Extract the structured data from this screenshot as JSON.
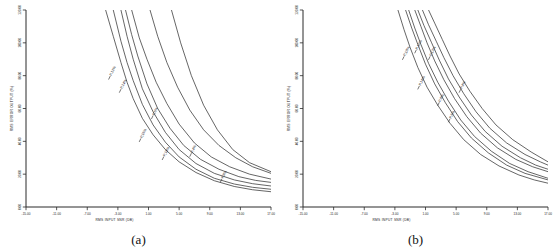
{
  "figure": {
    "panel_a_caption": "(a)",
    "panel_b_caption": "(b)"
  },
  "chart_data": [
    {
      "type": "line",
      "panel": "(a)",
      "title": "",
      "xlabel": "RMS INPUT SNR (DB)",
      "ylabel": "RMS ERROR OUTPUT (%)",
      "xlim": [
        -15.0,
        17.0
      ],
      "ylim": [
        0.0,
        120.0
      ],
      "xticks": [
        -15.0,
        -11.0,
        -7.0,
        -3.0,
        1.0,
        5.0,
        9.0,
        13.0,
        17.0
      ],
      "xticklabels": [
        "-15.00",
        "-11.00",
        "-7.00",
        "-3.00",
        "1.00",
        "5.00",
        "9.00",
        "13.00",
        "17.00"
      ],
      "yticks": [
        0.0,
        20.0,
        40.0,
        60.0,
        80.0,
        100.0,
        120.0
      ],
      "yticklabels": [
        "0.00",
        "20.00",
        "40.00",
        "60.00",
        "80.00",
        "100.00",
        "120.00"
      ],
      "grid": false,
      "legend": "inline-curve-labels",
      "series": [
        {
          "name": "P,12%",
          "label": "P,12%",
          "label_x": -3.6,
          "label_y": 82.0,
          "x": [
            -4.6,
            -3.6,
            -2.6,
            -1.8,
            -1.0,
            0.2,
            1.6,
            3.2,
            5.0,
            7.2,
            9.6,
            12.2,
            14.6,
            17.0
          ],
          "y": [
            120.0,
            104.0,
            88.0,
            76.0,
            66.0,
            54.0,
            44.0,
            35.0,
            27.5,
            21.0,
            16.0,
            12.5,
            10.5,
            9.3
          ]
        },
        {
          "name": "P,14%",
          "label": "P,14%",
          "label_x": -2.2,
          "label_y": 74.0,
          "x": [
            -3.6,
            -2.6,
            -1.8,
            -1.0,
            0.2,
            1.6,
            3.2,
            5.0,
            7.2,
            9.6,
            12.2,
            14.6,
            17.0
          ],
          "y": [
            120.0,
            101.0,
            88.0,
            77.0,
            62.5,
            50.0,
            39.5,
            30.5,
            23.0,
            17.5,
            14.0,
            12.0,
            10.8
          ]
        },
        {
          "name": "P,16%",
          "label": "P,16%",
          "label_x": 0.4,
          "label_y": 44.0,
          "x": [
            -2.6,
            -1.8,
            -1.0,
            0.2,
            1.6,
            3.2,
            5.0,
            7.2,
            9.6,
            12.2,
            14.6,
            17.0
          ],
          "y": [
            120.0,
            104.0,
            90.0,
            72.0,
            58.0,
            45.5,
            35.0,
            26.5,
            20.5,
            16.5,
            14.2,
            12.8
          ]
        },
        {
          "name": "P,18%",
          "label": "P,18%",
          "label_x": 3.4,
          "label_y": 33.0,
          "x": [
            -2.0,
            -1.2,
            -0.4,
            0.8,
            2.2,
            3.8,
            5.6,
            7.8,
            10.2,
            12.8,
            15.0,
            17.0
          ],
          "y": [
            120.0,
            105.0,
            92.0,
            75.0,
            60.0,
            48.0,
            37.5,
            29.0,
            23.0,
            18.5,
            16.2,
            15.0
          ]
        },
        {
          "name": "P,6%",
          "label": "P,6%",
          "label_x": 2.0,
          "label_y": 58.0,
          "x": [
            -1.2,
            -0.2,
            0.8,
            2.0,
            3.4,
            5.0,
            7.0,
            9.2,
            11.6,
            14.2,
            17.0
          ],
          "y": [
            120.0,
            103.0,
            90.0,
            76.0,
            63.0,
            50.5,
            39.0,
            30.5,
            24.5,
            20.0,
            17.0
          ]
        },
        {
          "name": "P,4%",
          "label": "P,4%",
          "label_x": 7.0,
          "label_y": 35.0,
          "x": [
            1.2,
            2.2,
            3.4,
            4.8,
            6.4,
            8.2,
            10.2,
            12.4,
            14.6,
            17.0
          ],
          "y": [
            120.0,
            104.0,
            88.0,
            73.0,
            59.0,
            47.0,
            37.5,
            30.0,
            24.5,
            20.5
          ]
        },
        {
          "name": "P,8%",
          "label": "P,8%",
          "label_x": 11.0,
          "label_y": 19.5,
          "x": [
            4.0,
            5.2,
            6.6,
            8.2,
            10.0,
            12.0,
            14.2,
            17.0
          ],
          "y": [
            120.0,
            100.0,
            80.0,
            62.0,
            47.0,
            35.0,
            27.0,
            21.5
          ]
        }
      ]
    },
    {
      "type": "line",
      "panel": "(b)",
      "title": "",
      "xlabel": "RMS INPUT SNR (DB)",
      "ylabel": "RMS ERROR OUTPUT (%)",
      "xlim": [
        -15.0,
        17.0
      ],
      "ylim": [
        0.0,
        120.0
      ],
      "xticks": [
        -15.0,
        -11.0,
        -7.0,
        -3.0,
        1.0,
        5.0,
        9.0,
        13.0,
        17.0
      ],
      "xticklabels": [
        "-15.00",
        "-11.00",
        "-7.00",
        "-3.00",
        "1.00",
        "5.00",
        "9.00",
        "13.00",
        "17.00"
      ],
      "yticks": [
        0.0,
        20.0,
        40.0,
        60.0,
        80.0,
        100.0,
        120.0
      ],
      "yticklabels": [
        "0.00",
        "20.00",
        "40.00",
        "60.00",
        "80.00",
        "100.00",
        "120.00"
      ],
      "grid": false,
      "legend": "inline-curve-labels",
      "series": [
        {
          "name": "P,18%",
          "label": "P,18%",
          "label_x": -1.4,
          "label_y": 94.0,
          "x": [
            -2.6,
            -1.8,
            -1.0,
            0.0,
            1.2,
            2.6,
            4.2,
            6.0,
            8.2,
            10.6,
            13.2,
            15.2,
            17.0
          ],
          "y": [
            120.0,
            108.0,
            97.0,
            85.0,
            73.0,
            62.0,
            51.0,
            41.0,
            32.0,
            25.0,
            19.5,
            16.5,
            14.5
          ]
        },
        {
          "name": "P,16%",
          "label": "P,16%",
          "label_x": 0.2,
          "label_y": 98.0,
          "x": [
            -1.6,
            -0.8,
            0.0,
            1.0,
            2.2,
            3.6,
            5.2,
            7.0,
            9.2,
            11.6,
            14.0,
            17.0
          ],
          "y": [
            120.0,
            109.0,
            99.0,
            87.0,
            75.0,
            63.5,
            52.0,
            42.0,
            33.0,
            25.5,
            20.5,
            16.5
          ]
        },
        {
          "name": "P,14%",
          "label": "P,14%",
          "label_x": 0.6,
          "label_y": 76.0,
          "x": [
            -1.2,
            -0.4,
            0.4,
            1.4,
            2.6,
            4.0,
            5.6,
            7.4,
            9.6,
            12.0,
            14.4,
            17.0
          ],
          "y": [
            120.0,
            109.0,
            99.0,
            87.5,
            76.0,
            64.5,
            53.0,
            43.0,
            34.0,
            26.5,
            21.5,
            17.5
          ]
        },
        {
          "name": "P,12%",
          "label": "P,12%",
          "label_x": 2.0,
          "label_y": 94.0,
          "x": [
            -0.4,
            0.4,
            1.2,
            2.2,
            3.4,
            4.8,
            6.4,
            8.2,
            10.4,
            12.8,
            15.0,
            17.0
          ],
          "y": [
            120.0,
            110.0,
            100.0,
            89.0,
            77.5,
            66.0,
            55.0,
            45.0,
            36.0,
            29.0,
            24.5,
            21.5
          ]
        },
        {
          "name": "P,8%",
          "label": "P,8%",
          "label_x": 3.2,
          "label_y": 66.0,
          "x": [
            0.0,
            0.8,
            1.8,
            2.8,
            4.0,
            5.4,
            7.0,
            8.8,
            11.0,
            13.4,
            15.4,
            17.0
          ],
          "y": [
            120.0,
            110.5,
            100.0,
            89.5,
            78.0,
            67.0,
            56.0,
            46.0,
            37.0,
            30.0,
            25.5,
            23.0
          ]
        },
        {
          "name": "P,6%",
          "label": "P,6%",
          "label_x": 4.6,
          "label_y": 56.0,
          "x": [
            0.6,
            1.4,
            2.4,
            3.4,
            4.6,
            6.0,
            7.6,
            9.4,
            11.6,
            14.0,
            16.0,
            17.0
          ],
          "y": [
            120.0,
            111.0,
            101.0,
            91.0,
            80.0,
            69.0,
            58.0,
            48.0,
            39.0,
            32.0,
            27.5,
            25.5
          ]
        },
        {
          "name": "P,4%",
          "label": "P,4%",
          "label_x": 6.0,
          "label_y": 74.0,
          "x": [
            1.4,
            2.2,
            3.2,
            4.2,
            5.4,
            6.8,
            8.4,
            10.2,
            12.4,
            14.8,
            17.0
          ],
          "y": [
            120.0,
            112.0,
            102.0,
            92.0,
            81.0,
            70.5,
            60.0,
            50.0,
            41.0,
            33.5,
            27.5
          ]
        }
      ]
    }
  ]
}
